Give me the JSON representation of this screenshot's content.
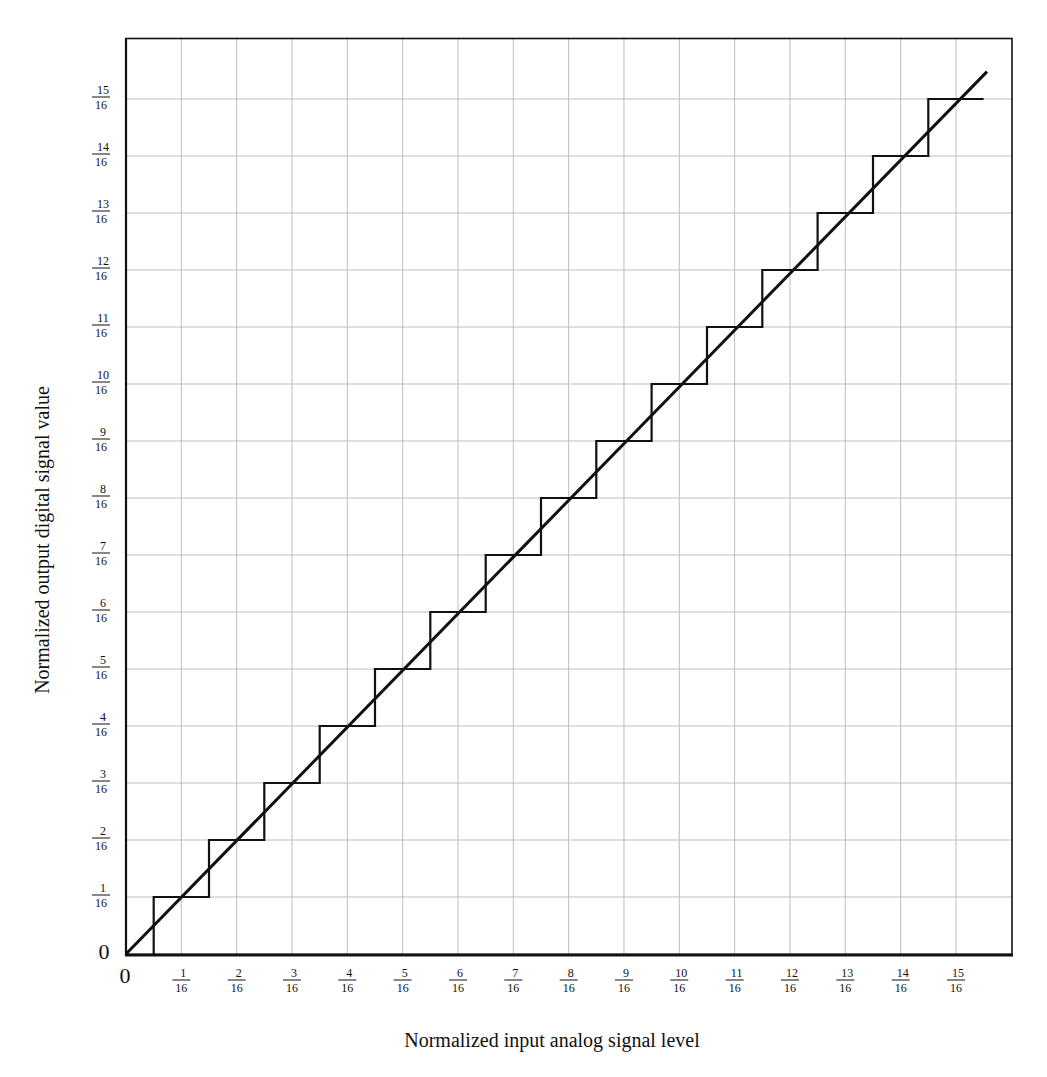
{
  "chart_data": {
    "type": "line",
    "title": "",
    "xlabel": "Normalized input analog signal level",
    "ylabel": "Normalized output digital signal value",
    "xlim": [
      0,
      1
    ],
    "ylim": [
      0,
      1
    ],
    "grid": true,
    "legend": null,
    "x_ticks": [
      {
        "value": 0,
        "label": "0"
      },
      {
        "value": 0.0625,
        "num": "1",
        "den": "16"
      },
      {
        "value": 0.125,
        "num": "2",
        "den": "16"
      },
      {
        "value": 0.1875,
        "num": "3",
        "den": "16"
      },
      {
        "value": 0.25,
        "num": "4",
        "den": "16"
      },
      {
        "value": 0.3125,
        "num": "5",
        "den": "16"
      },
      {
        "value": 0.375,
        "num": "6",
        "den": "16"
      },
      {
        "value": 0.4375,
        "num": "7",
        "den": "16"
      },
      {
        "value": 0.5,
        "num": "8",
        "den": "16"
      },
      {
        "value": 0.5625,
        "num": "9",
        "den": "16"
      },
      {
        "value": 0.625,
        "num": "10",
        "den": "16"
      },
      {
        "value": 0.6875,
        "num": "11",
        "den": "16"
      },
      {
        "value": 0.75,
        "num": "12",
        "den": "16"
      },
      {
        "value": 0.8125,
        "num": "13",
        "den": "16"
      },
      {
        "value": 0.875,
        "num": "14",
        "den": "16"
      },
      {
        "value": 0.9375,
        "num": "15",
        "den": "16"
      }
    ],
    "y_ticks": [
      {
        "value": 0,
        "label": "0"
      },
      {
        "value": 0.0625,
        "num": "1",
        "den": "16"
      },
      {
        "value": 0.125,
        "num": "2",
        "den": "16"
      },
      {
        "value": 0.1875,
        "num": "3",
        "den": "16"
      },
      {
        "value": 0.25,
        "num": "4",
        "den": "16"
      },
      {
        "value": 0.3125,
        "num": "5",
        "den": "16"
      },
      {
        "value": 0.375,
        "num": "6",
        "den": "16"
      },
      {
        "value": 0.4375,
        "num": "7",
        "den": "16"
      },
      {
        "value": 0.5,
        "num": "8",
        "den": "16"
      },
      {
        "value": 0.5625,
        "num": "9",
        "den": "16"
      },
      {
        "value": 0.625,
        "num": "10",
        "den": "16"
      },
      {
        "value": 0.6875,
        "num": "11",
        "den": "16"
      },
      {
        "value": 0.75,
        "num": "12",
        "den": "16"
      },
      {
        "value": 0.8125,
        "num": "13",
        "den": "16"
      },
      {
        "value": 0.875,
        "num": "14",
        "den": "16"
      },
      {
        "value": 0.9375,
        "num": "15",
        "den": "16"
      }
    ],
    "series": [
      {
        "name": "ideal transfer (diagonal)",
        "style": "solid",
        "x": [
          0,
          0.9725
        ],
        "y": [
          0,
          0.9675
        ]
      },
      {
        "name": "quantized staircase output",
        "style": "step",
        "x": [
          0.03125,
          0.03125,
          0.09375,
          0.09375,
          0.15625,
          0.15625,
          0.21875,
          0.21875,
          0.28125,
          0.28125,
          0.34375,
          0.34375,
          0.40625,
          0.40625,
          0.46875,
          0.46875,
          0.53125,
          0.53125,
          0.59375,
          0.59375,
          0.65625,
          0.65625,
          0.71875,
          0.71875,
          0.78125,
          0.78125,
          0.84375,
          0.84375,
          0.90625,
          0.90625,
          0.96875
        ],
        "y": [
          0,
          0.0625,
          0.0625,
          0.125,
          0.125,
          0.1875,
          0.1875,
          0.25,
          0.25,
          0.3125,
          0.3125,
          0.375,
          0.375,
          0.4375,
          0.4375,
          0.5,
          0.5,
          0.5625,
          0.5625,
          0.625,
          0.625,
          0.6875,
          0.6875,
          0.75,
          0.75,
          0.8125,
          0.8125,
          0.875,
          0.875,
          0.9375,
          0.9375
        ]
      }
    ]
  },
  "colors": {
    "line": "#111111",
    "grid": "#bdbdbd",
    "frame": "#111111",
    "background": "#ffffff"
  }
}
